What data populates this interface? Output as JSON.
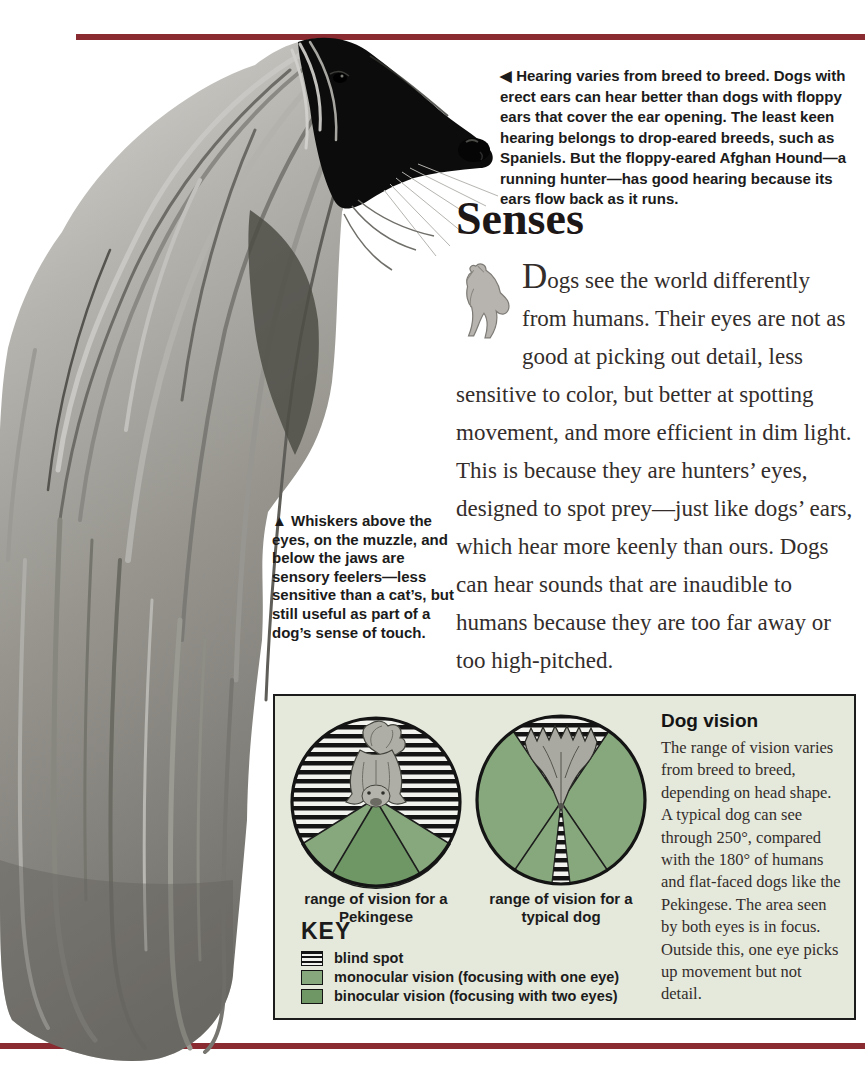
{
  "colors": {
    "rule_maroon": "#8a2b31",
    "panel_background": "#e5e9dc",
    "monocular_green": "#87a87c",
    "binocular_green": "#6e9765",
    "stripe_black": "#141414"
  },
  "hearing_caption": {
    "marker": "◀",
    "text": "Hearing varies from breed to breed. Dogs with erect ears can hear better than dogs with floppy ears that cover the ear opening. The least keen hearing belongs to drop-eared breeds, such as Spaniels. But the floppy-eared Afghan Hound—a running hunter—has good hearing because its ears flow back as it runs."
  },
  "heading": "Senses",
  "body_text": {
    "dropcap": "D",
    "after_dropcap": "ogs see the world differently from humans. Their eyes are not as good at picking out detail, less sensitive to color, but better at spotting movement, and more efficient in dim light. This is because they are hunters’ eyes, designed to spot prey—just like dogs’ ears, which hear more keenly than ours. Dogs can hear sounds that are inaudible to humans because they are too far away or too high-pitched."
  },
  "whiskers_caption": {
    "marker": "▲",
    "text": "Whiskers above the eyes, on the muzzle, and below the jaws are sensory feelers—less sensitive than a cat’s, but still useful as part of a dog’s sense of touch."
  },
  "vision_panel": {
    "pekingese_caption_line1": "range of vision for a",
    "pekingese_caption_line2": "Pekingese",
    "typical_caption_line1": "range of vision for a",
    "typical_caption_line2": "typical dog",
    "key_title": "KEY",
    "key_items": [
      {
        "label": "blind spot",
        "swatch": "stripes"
      },
      {
        "label": "monocular vision (focusing with one eye)",
        "swatch": "#87a87c"
      },
      {
        "label": "binocular vision (focusing with two eyes)",
        "swatch": "#6e9765"
      }
    ],
    "sidebar_title": "Dog vision",
    "sidebar_text": "The range of vision varies from breed to breed, depending on head shape. A typical dog can see through 250°, compared with the 180° of humans and flat-faced dogs like the Pekingese. The area seen by both eyes is in focus. Outside this, one eye picks up movement but not detail."
  }
}
